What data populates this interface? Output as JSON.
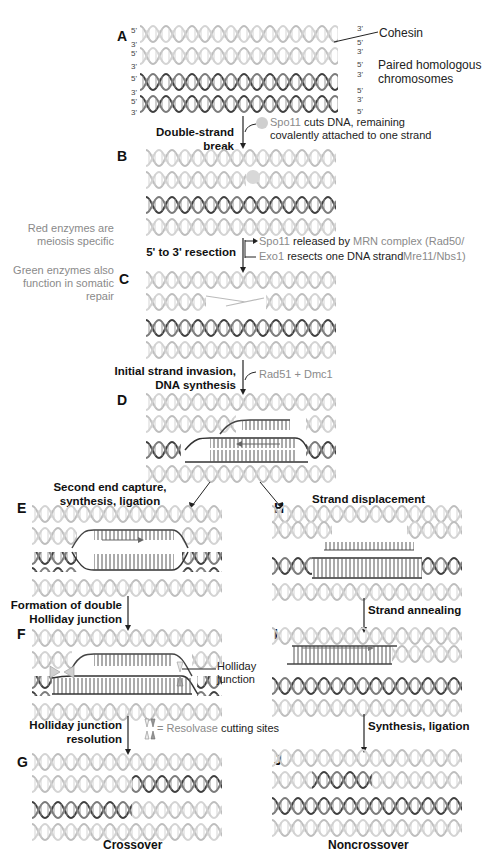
{
  "figure": {
    "panels": {
      "A": "A",
      "B": "B",
      "C": "C",
      "D": "D",
      "E": "E",
      "F": "F",
      "G": "G",
      "H": "H",
      "I": "I",
      "J": "J"
    },
    "ends_left": [
      "5'",
      "3'",
      "5'",
      "3'",
      "5'",
      "3'",
      "5'",
      "3'"
    ],
    "ends_right": [
      "3'",
      "5'",
      "3'",
      "5'",
      "3'",
      "5'",
      "3'",
      "5'"
    ],
    "labels": {
      "cohesin": "Cohesin",
      "paired_line1": "Paired homologous",
      "paired_line2": "chromosomes",
      "holliday_line1": "Holliday",
      "holliday_line2": "junction"
    },
    "legend": {
      "red_line1": "Red enzymes are",
      "red_line2": "meiosis specific",
      "green_line1": "Green enzymes also",
      "green_line2": "function in somatic",
      "green_line3": "repair",
      "resolvase_eq": "=",
      "resolvase_enzyme": "Resolvase",
      "resolvase_rest": " cutting sites"
    },
    "steps": {
      "dsb": "Double-strand break",
      "resection": "5' to 3' resection",
      "invasion_line1": "Initial strand invasion,",
      "invasion_line2": "DNA synthesis",
      "second_end_line1": "Second end capture,",
      "second_end_line2": "synthesis, ligation",
      "double_hj_line1": "Formation of double",
      "double_hj_line2": "Holliday junction",
      "hj_res_line1": "Holliday junction",
      "hj_res_line2": "resolution",
      "strand_displacement": "Strand displacement",
      "strand_annealing": "Strand annealing",
      "synthesis_ligation": "Synthesis, ligation"
    },
    "enzymes": {
      "spo11_name": "Spo11",
      "spo11_cut_rest_line1": " cuts DNA, remaining",
      "spo11_cut_line2": "covalently attached to one strand",
      "spo11_release_name": "Spo11",
      "spo11_release_mid": " released by ",
      "mrn": "MRN complex (Rad50/",
      "mrn_line2": "Mre11/Nbs1)",
      "exo1_name": "Exo1",
      "exo1_rest": " resects one DNA strand",
      "rad51_dmc1": "Rad51 + Dmc1"
    },
    "outcomes": {
      "crossover": "Crossover",
      "noncrossover": "Noncrossover"
    },
    "colors": {
      "text": "#111111",
      "enzyme_gray": "#8a8a8a",
      "helix_dark": "#4a4a4a",
      "helix_light": "#c8c8c8"
    }
  }
}
